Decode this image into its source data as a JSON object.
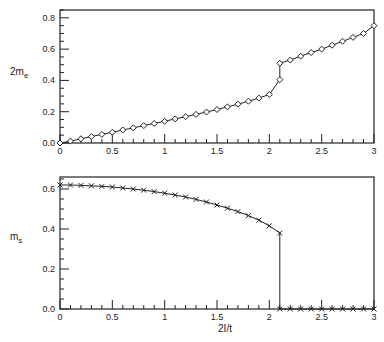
{
  "chart_data": [
    {
      "type": "line",
      "title": "",
      "xlabel": "",
      "ylabel": "2m_e",
      "ylabel_main": "2m",
      "ylabel_sub": "e",
      "xlim": [
        0,
        3
      ],
      "ylim": [
        0,
        0.85
      ],
      "xticks": [
        "0",
        "0.5",
        "1",
        "1.5",
        "2",
        "2.5",
        "3"
      ],
      "yticks": [
        "0.0",
        "0.2",
        "0.4",
        "0.6",
        "0.8"
      ],
      "grid": false,
      "marker": "diamond",
      "series": [
        {
          "name": "2m_e",
          "x": [
            0,
            0.1,
            0.2,
            0.3,
            0.4,
            0.5,
            0.6,
            0.7,
            0.8,
            0.9,
            1.0,
            1.1,
            1.2,
            1.3,
            1.4,
            1.5,
            1.6,
            1.7,
            1.8,
            1.9,
            2.0,
            2.1,
            2.1,
            2.2,
            2.3,
            2.4,
            2.5,
            2.6,
            2.7,
            2.8,
            2.9,
            3.0
          ],
          "values": [
            0.0,
            0.012,
            0.027,
            0.041,
            0.055,
            0.069,
            0.083,
            0.097,
            0.111,
            0.125,
            0.139,
            0.154,
            0.168,
            0.183,
            0.198,
            0.214,
            0.231,
            0.248,
            0.267,
            0.287,
            0.31,
            0.405,
            0.51,
            0.53,
            0.555,
            0.578,
            0.6,
            0.625,
            0.65,
            0.675,
            0.7,
            0.75
          ]
        }
      ]
    },
    {
      "type": "line",
      "title": "",
      "xlabel": "2I/t",
      "ylabel": "m_s",
      "ylabel_main": "m",
      "ylabel_sub": "s",
      "xlim": [
        0,
        3
      ],
      "ylim": [
        0,
        0.66
      ],
      "xticks": [
        "0",
        "0.5",
        "1",
        "1.5",
        "2",
        "2.5",
        "3"
      ],
      "yticks": [
        "0.0",
        "0.2",
        "0.4",
        "0.6"
      ],
      "grid": false,
      "marker": "x",
      "series": [
        {
          "name": "m_s",
          "x": [
            0,
            0.1,
            0.2,
            0.3,
            0.4,
            0.5,
            0.6,
            0.7,
            0.8,
            0.9,
            1.0,
            1.1,
            1.2,
            1.3,
            1.4,
            1.5,
            1.6,
            1.7,
            1.8,
            1.9,
            2.0,
            2.1,
            2.1,
            2.2,
            2.3,
            2.4,
            2.5,
            2.6,
            2.7,
            2.8,
            2.9,
            3.0
          ],
          "values": [
            0.62,
            0.62,
            0.618,
            0.616,
            0.613,
            0.61,
            0.605,
            0.6,
            0.594,
            0.587,
            0.579,
            0.57,
            0.56,
            0.548,
            0.535,
            0.52,
            0.504,
            0.487,
            0.467,
            0.444,
            0.416,
            0.38,
            0.0,
            0.0,
            0.0,
            0.0,
            0.0,
            0.0,
            0.0,
            0.0,
            0.0,
            0.0
          ]
        }
      ]
    }
  ]
}
